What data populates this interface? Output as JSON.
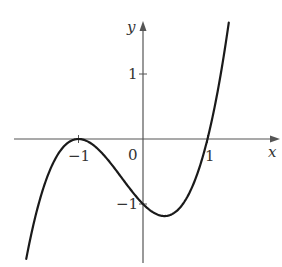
{
  "chart_data": {
    "type": "line",
    "title": "",
    "function": "f(x) = (x+1)^2 (x-1)",
    "xlabel": "x",
    "ylabel": "y",
    "origin_label": "0",
    "x_ticks": [
      {
        "value": -1,
        "label": "−1"
      },
      {
        "value": 1,
        "label": "1"
      }
    ],
    "y_ticks": [
      {
        "value": 1,
        "label": "1"
      },
      {
        "value": -1,
        "label": "−1"
      }
    ],
    "xlim": [
      -2.0,
      2.1
    ],
    "ylim": [
      -1.9,
      2.0
    ],
    "grid": false,
    "key_points": [
      {
        "x": -1,
        "y": 0,
        "note": "local maximum / double root"
      },
      {
        "x": 0,
        "y": -1,
        "note": "y-intercept"
      },
      {
        "x": 0.333,
        "y": -1.185,
        "note": "local minimum"
      },
      {
        "x": 1,
        "y": 0,
        "note": "root"
      }
    ],
    "x_range_plotted": [
      -1.81,
      1.33
    ],
    "colors": {
      "curve": "#1a1a1a",
      "axes": "#555555",
      "text": "#333333"
    }
  }
}
